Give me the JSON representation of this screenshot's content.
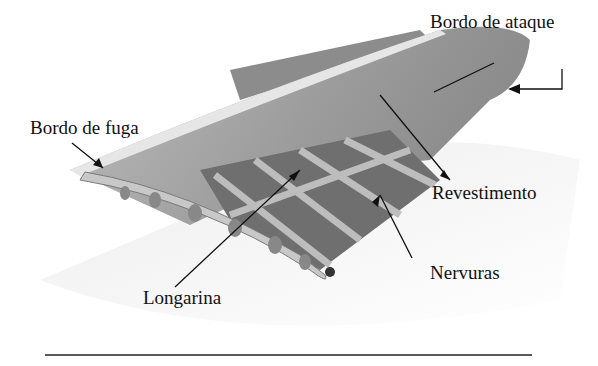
{
  "figure": {
    "labels": {
      "leading_edge": "Bordo de ataque",
      "trailing_edge": "Bordo de fuga",
      "skin": "Revestimento",
      "ribs": "Nervuras",
      "spar": "Longarina"
    },
    "colors": {
      "wing_skin": "#9a9a9a",
      "wing_dark": "#6e6e6e",
      "rib": "#b5b5b5",
      "text": "#111111",
      "rule": "#222222"
    }
  }
}
